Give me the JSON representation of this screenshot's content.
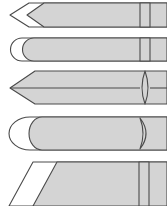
{
  "diagram": {
    "title": "",
    "colors": {
      "body_fill": "#d4d4d4",
      "tip_fill": "#ffffff",
      "stroke": "#4a4a4a",
      "background": "#ffffff"
    },
    "tips": [
      {
        "id": "tip-1",
        "shape": "conical-bevel",
        "band": "rectangle"
      },
      {
        "id": "tip-2",
        "shape": "rounded-chisel",
        "band": "rectangle"
      },
      {
        "id": "tip-3",
        "shape": "conical",
        "band": "lens"
      },
      {
        "id": "tip-4",
        "shape": "rounded-large",
        "band": "crescent"
      },
      {
        "id": "tip-5",
        "shape": "bevel-angled",
        "band": "rectangle"
      }
    ]
  }
}
